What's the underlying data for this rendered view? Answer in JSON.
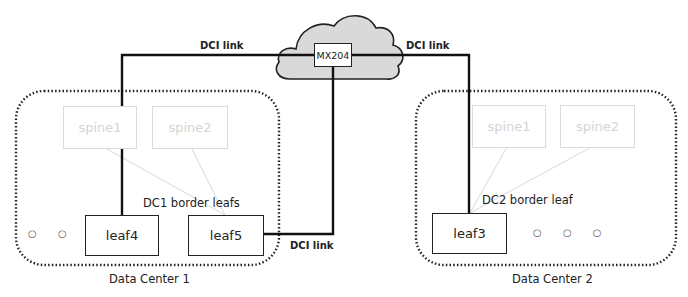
{
  "diagram": {
    "cloud": {
      "router_label": "MX204",
      "fill": "#d9d9d9"
    },
    "links": [
      {
        "label": "DCI link",
        "from": "leaf4",
        "to": "MX204"
      },
      {
        "label": "DCI link",
        "from": "MX204",
        "to": "leaf3"
      },
      {
        "label": "DCI link",
        "from": "leaf5",
        "to": "MX204"
      }
    ],
    "dc1": {
      "name": "Data Center 1",
      "group_label": "DC1 border leafs",
      "spines": [
        "spine1",
        "spine2"
      ],
      "leaves": [
        "leaf4",
        "leaf5"
      ],
      "ellipsis": "○ ○ ○"
    },
    "dc2": {
      "name": "Data Center 2",
      "group_label": "DC2 border leaf",
      "spines": [
        "spine1",
        "spine2"
      ],
      "leaves": [
        "leaf3"
      ],
      "ellipsis": "○ ○ ○"
    }
  }
}
